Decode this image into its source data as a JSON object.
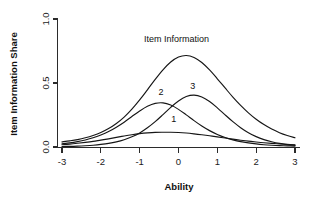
{
  "chart_data": {
    "type": "line",
    "title": "",
    "xlabel": "Ability",
    "ylabel": "Item Information Share",
    "xlim": [
      -3,
      3
    ],
    "ylim": [
      0,
      1
    ],
    "grid": false,
    "legend_position": "inline-annotations",
    "xticks": [
      "-3",
      "-2",
      "-1",
      "0",
      "1",
      "2",
      "3"
    ],
    "xtick_values": [
      -3,
      -2,
      -1,
      0,
      1,
      2,
      3
    ],
    "yticks": [
      "0.0",
      "0.5",
      "1.0"
    ],
    "ytick_values": [
      0.0,
      0.5,
      1.0
    ],
    "annotations": [
      {
        "text": "Item Information",
        "x": -0.05,
        "y": 0.82
      },
      {
        "text": "2",
        "x": -0.45,
        "y": 0.41
      },
      {
        "text": "3",
        "x": 0.37,
        "y": 0.45
      },
      {
        "text": "1",
        "x": -0.12,
        "y": 0.195
      }
    ],
    "series": [
      {
        "name": "Item Information",
        "peak_x": -0.05,
        "peak_y": 0.72,
        "x": [
          -3.0,
          -2.8,
          -2.6,
          -2.4,
          -2.2,
          -2.0,
          -1.8,
          -1.6,
          -1.4,
          -1.2,
          -1.0,
          -0.8,
          -0.6,
          -0.4,
          -0.2,
          0.0,
          0.2,
          0.4,
          0.6,
          0.8,
          1.0,
          1.2,
          1.4,
          1.6,
          1.8,
          2.0,
          2.2,
          2.4,
          2.6,
          2.8,
          3.0
        ],
        "values": [
          0.04,
          0.048,
          0.058,
          0.072,
          0.09,
          0.113,
          0.144,
          0.184,
          0.234,
          0.296,
          0.368,
          0.447,
          0.528,
          0.603,
          0.664,
          0.703,
          0.715,
          0.7,
          0.66,
          0.602,
          0.533,
          0.461,
          0.39,
          0.325,
          0.267,
          0.217,
          0.175,
          0.14,
          0.112,
          0.09,
          0.072
        ]
      },
      {
        "name": "2",
        "peak_x": -0.55,
        "peak_y": 0.345,
        "x": [
          -3.0,
          -2.8,
          -2.6,
          -2.4,
          -2.2,
          -2.0,
          -1.8,
          -1.6,
          -1.4,
          -1.2,
          -1.0,
          -0.8,
          -0.6,
          -0.4,
          -0.2,
          0.0,
          0.2,
          0.4,
          0.6,
          0.8,
          1.0,
          1.2,
          1.4,
          1.6,
          1.8,
          2.0,
          2.2,
          2.4,
          2.6,
          2.8,
          3.0
        ],
        "values": [
          0.025,
          0.032,
          0.042,
          0.055,
          0.072,
          0.094,
          0.121,
          0.155,
          0.194,
          0.238,
          0.281,
          0.318,
          0.341,
          0.345,
          0.328,
          0.294,
          0.251,
          0.206,
          0.164,
          0.128,
          0.098,
          0.074,
          0.056,
          0.042,
          0.032,
          0.024,
          0.018,
          0.014,
          0.011,
          0.009,
          0.007
        ]
      },
      {
        "name": "3",
        "peak_x": 0.4,
        "peak_y": 0.405,
        "x": [
          -3.0,
          -2.8,
          -2.6,
          -2.4,
          -2.2,
          -2.0,
          -1.8,
          -1.6,
          -1.4,
          -1.2,
          -1.0,
          -0.8,
          -0.6,
          -0.4,
          -0.2,
          0.0,
          0.2,
          0.4,
          0.6,
          0.8,
          1.0,
          1.2,
          1.4,
          1.6,
          1.8,
          2.0,
          2.2,
          2.4,
          2.6,
          2.8,
          3.0
        ],
        "values": [
          0.004,
          0.005,
          0.007,
          0.01,
          0.014,
          0.02,
          0.028,
          0.04,
          0.057,
          0.08,
          0.11,
          0.15,
          0.198,
          0.253,
          0.31,
          0.36,
          0.394,
          0.405,
          0.391,
          0.355,
          0.306,
          0.251,
          0.198,
          0.151,
          0.112,
          0.081,
          0.058,
          0.041,
          0.028,
          0.019,
          0.013
        ]
      },
      {
        "name": "1",
        "peak_x": -0.2,
        "peak_y": 0.115,
        "x": [
          -3.0,
          -2.8,
          -2.6,
          -2.4,
          -2.2,
          -2.0,
          -1.8,
          -1.6,
          -1.4,
          -1.2,
          -1.0,
          -0.8,
          -0.6,
          -0.4,
          -0.2,
          0.0,
          0.2,
          0.4,
          0.6,
          0.8,
          1.0,
          1.2,
          1.4,
          1.6,
          1.8,
          2.0,
          2.2,
          2.4,
          2.6,
          2.8,
          3.0
        ],
        "values": [
          0.018,
          0.023,
          0.029,
          0.036,
          0.044,
          0.054,
          0.064,
          0.075,
          0.086,
          0.096,
          0.104,
          0.11,
          0.114,
          0.115,
          0.115,
          0.113,
          0.109,
          0.103,
          0.096,
          0.088,
          0.079,
          0.07,
          0.061,
          0.053,
          0.046,
          0.039,
          0.033,
          0.028,
          0.024,
          0.02,
          0.017
        ]
      }
    ]
  },
  "axes": {
    "x_label": "Ability",
    "y_label": "Item Information Share"
  }
}
